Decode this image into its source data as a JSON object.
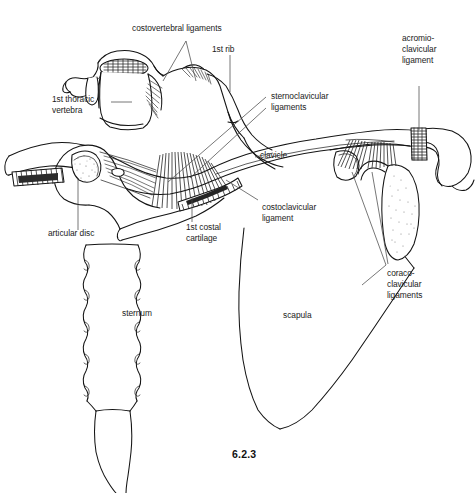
{
  "figure": {
    "number": "6.2.3",
    "background_color": "#ffffff",
    "line_color": "#141414",
    "leader_color": "#4a4a4a",
    "text_color": "#1b1b1b"
  },
  "labels": {
    "costovertebral_ligaments": "costovertebral ligaments",
    "first_rib": "1st rib",
    "acromioclavicular_ligament_l1": "acromio-",
    "acromioclavicular_ligament_l2": "clavicular",
    "acromioclavicular_ligament_l3": "ligament",
    "first_thoracic_vertebra_l1": "1st thoracic",
    "first_thoracic_vertebra_l2": "vertebra",
    "sternoclavicular_ligaments_l1": "sternoclavicular",
    "sternoclavicular_ligaments_l2": "ligaments",
    "clavicle": "clavicle",
    "costoclavicular_ligament_l1": "costoclavicular",
    "costoclavicular_ligament_l2": "ligament",
    "articular_disc": "articular disc",
    "first_costal_cartilage_l1": "1st costal",
    "first_costal_cartilage_l2": "cartilage",
    "sternum": "sternum",
    "scapula": "scapula",
    "coracoclavicular_ligaments_l1": "coraco-",
    "coracoclavicular_ligaments_l2": "clavicular",
    "coracoclavicular_ligaments_l3": "ligaments"
  }
}
